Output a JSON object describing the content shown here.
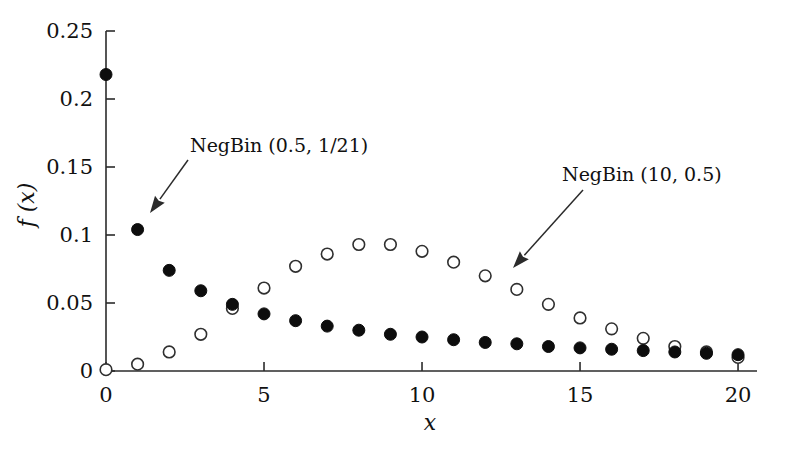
{
  "chart_data": {
    "type": "scatter",
    "title": "",
    "subtitle": "",
    "xlabel": "x",
    "ylabel": "f (x)",
    "xlim": [
      0,
      20.6
    ],
    "ylim": [
      0,
      0.25
    ],
    "xticks": [
      0,
      5,
      10,
      15,
      20
    ],
    "xticklabels": [
      "0",
      "5",
      "10",
      "15",
      "20"
    ],
    "yticks": [
      0,
      0.05,
      0.1,
      0.15,
      0.2,
      0.25
    ],
    "yticklabels": [
      "0",
      "0.05",
      "0.1",
      "0.15",
      "0.2",
      "0.25"
    ],
    "grid": false,
    "legend_position": "annotations",
    "x": [
      0,
      1,
      2,
      3,
      4,
      5,
      6,
      7,
      8,
      9,
      10,
      11,
      12,
      13,
      14,
      15,
      16,
      17,
      18,
      19,
      20
    ],
    "series": [
      {
        "name": "NegBin (0.5, 1/21)",
        "marker": "filled-circle",
        "color": "#0d0d0d",
        "values": [
          0.218,
          0.104,
          0.074,
          0.059,
          0.049,
          0.042,
          0.037,
          0.033,
          0.03,
          0.027,
          0.025,
          0.023,
          0.021,
          0.02,
          0.018,
          0.017,
          0.016,
          0.015,
          0.014,
          0.013,
          0.012
        ]
      },
      {
        "name": "NegBin (10, 0.5)",
        "marker": "open-circle",
        "color": "#2f2f2f",
        "values": [
          0.001,
          0.005,
          0.014,
          0.027,
          0.046,
          0.061,
          0.077,
          0.086,
          0.093,
          0.093,
          0.088,
          0.08,
          0.07,
          0.06,
          0.049,
          0.039,
          0.031,
          0.024,
          0.018,
          0.014,
          0.01
        ]
      }
    ],
    "annotations": [
      {
        "text": "NegBin (0.5, 1/21)",
        "text_x": 190,
        "text_y": 152,
        "arrow_from_x": 188,
        "arrow_from_y": 160,
        "arrow_to_x": 150,
        "arrow_to_y": 213
      },
      {
        "text": "NegBin (10, 0.5)",
        "text_x": 562,
        "text_y": 181,
        "arrow_from_x": 583,
        "arrow_from_y": 190,
        "arrow_to_x": 513,
        "arrow_to_y": 268
      }
    ]
  }
}
